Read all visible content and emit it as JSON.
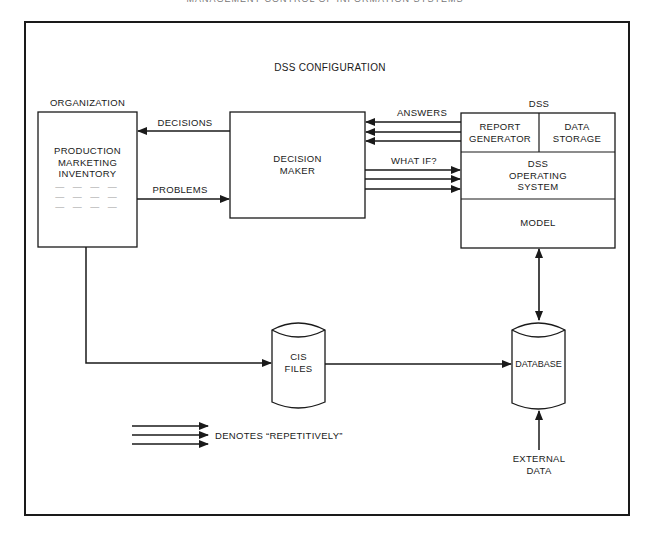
{
  "page_header": "MANAGEMENT CONTROL OF INFORMATION SYSTEMS",
  "diagram": {
    "title": "DSS CONFIGURATION",
    "organization": {
      "heading": "ORGANIZATION",
      "lines": [
        "PRODUCTION",
        "MARKETING",
        "INVENTORY"
      ],
      "placeholder_rows": [
        "— — — —",
        "— — — —",
        "— — — —"
      ]
    },
    "decision_maker": {
      "line1": "DECISION",
      "line2": "MAKER"
    },
    "dss": {
      "heading": "DSS",
      "report_generator": {
        "line1": "REPORT",
        "line2": "GENERATOR"
      },
      "data_storage": {
        "line1": "DATA",
        "line2": "STORAGE"
      },
      "operating_system": {
        "line1": "DSS",
        "line2": "OPERATING",
        "line3": "SYSTEM"
      },
      "model": "MODEL"
    },
    "flows": {
      "decisions": "DECISIONS",
      "problems": "PROBLEMS",
      "answers": "ANSWERS",
      "what_if": "WHAT IF?"
    },
    "cis_files": {
      "line1": "CIS",
      "line2": "FILES"
    },
    "database": "DATABASE",
    "external_data": {
      "line1": "EXTERNAL",
      "line2": "DATA"
    },
    "legend": {
      "text": "DENOTES “REPETITIVELY”"
    },
    "colors": {
      "line": "#1a1a1a",
      "background": "#ffffff"
    }
  }
}
